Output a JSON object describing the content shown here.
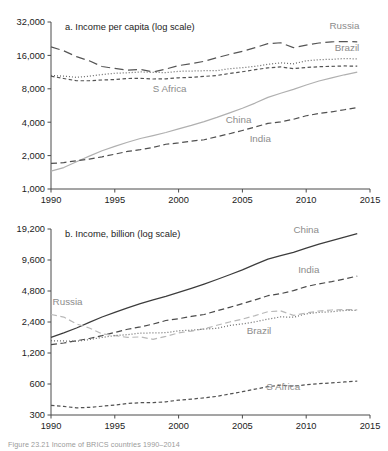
{
  "figure": {
    "caption": "Figure 23.21 Income of BRICS countries 1990–2014"
  },
  "chart_data": [
    {
      "id": "a",
      "type": "line",
      "title": "a. Income per capita (log scale)",
      "xlabel": "",
      "ylabel": "",
      "scale": "log",
      "grid": false,
      "legend_position": "inline-labels",
      "xlim": [
        1990,
        2015
      ],
      "ylim": [
        1000,
        32000
      ],
      "xticks": [
        1990,
        1995,
        2000,
        2005,
        2010,
        2015
      ],
      "xtick_labels": [
        "1990",
        "1995",
        "2000",
        "2005",
        "2010",
        "2015"
      ],
      "yticks": [
        1000,
        2000,
        4000,
        8000,
        16000,
        32000
      ],
      "ytick_labels": [
        "1,000",
        "2,000",
        "4,000",
        "8,000",
        "16,000",
        "32,000"
      ],
      "x": [
        1990,
        1991,
        1992,
        1993,
        1994,
        1995,
        1996,
        1997,
        1998,
        1999,
        2000,
        2001,
        2002,
        2003,
        2004,
        2005,
        2006,
        2007,
        2008,
        2009,
        2010,
        2011,
        2012,
        2013,
        2014
      ],
      "series": [
        {
          "name": "Russia",
          "style": "long-dash",
          "color": "#555555",
          "label_x": 2013.0,
          "label_y": 27500,
          "values": [
            19100,
            17600,
            15600,
            14300,
            12700,
            12200,
            11800,
            11950,
            11350,
            12050,
            12950,
            13500,
            14150,
            15250,
            16350,
            17400,
            18800,
            20400,
            20800,
            18800,
            19800,
            20700,
            21200,
            21350,
            21200
          ]
        },
        {
          "name": "Brazil",
          "style": "dotted",
          "color": "#6a6a6a",
          "label_x": 2013.2,
          "label_y": 17600,
          "values": [
            10550,
            10400,
            10150,
            10400,
            10750,
            11050,
            11150,
            11350,
            11250,
            11200,
            11500,
            11550,
            11650,
            11650,
            12150,
            12400,
            12750,
            13300,
            13700,
            13450,
            14300,
            14650,
            14750,
            15000,
            14850
          ]
        },
        {
          "name": "S Africa",
          "style": "short-dash",
          "color": "#545454",
          "label_x": 1999.3,
          "label_y": 7450,
          "values": [
            10400,
            9900,
            9450,
            9450,
            9600,
            9700,
            9900,
            9950,
            9800,
            9850,
            10050,
            10150,
            10350,
            10550,
            11000,
            11400,
            11900,
            12350,
            12600,
            12150,
            12450,
            12650,
            12750,
            12850,
            12800
          ]
        },
        {
          "name": "China",
          "style": "solid",
          "color": "#b0b0b0",
          "label_x": 2004.7,
          "label_y": 3900,
          "values": [
            1450,
            1560,
            1760,
            1980,
            2210,
            2420,
            2640,
            2850,
            3030,
            3230,
            3480,
            3740,
            4050,
            4420,
            4860,
            5350,
            5950,
            6700,
            7300,
            7900,
            8650,
            9400,
            10050,
            10700,
            11300
          ]
        },
        {
          "name": "India",
          "style": "medium-dash",
          "color": "#4f4f4f",
          "label_x": 2006.4,
          "label_y": 2650,
          "values": [
            1700,
            1730,
            1800,
            1860,
            1950,
            2060,
            2180,
            2260,
            2370,
            2530,
            2600,
            2700,
            2780,
            2960,
            3150,
            3370,
            3620,
            3900,
            4030,
            4250,
            4570,
            4790,
            4960,
            5180,
            5430
          ]
        }
      ]
    },
    {
      "id": "b",
      "type": "line",
      "title": "b. Income, billion (log scale)",
      "xlabel": "",
      "ylabel": "",
      "scale": "log",
      "grid": false,
      "legend_position": "inline-labels",
      "xlim": [
        1990,
        2015
      ],
      "ylim": [
        300,
        19200
      ],
      "xticks": [
        1990,
        1995,
        2000,
        2005,
        2010,
        2015
      ],
      "xtick_labels": [
        "1990",
        "1995",
        "2000",
        "2005",
        "2010",
        "2015"
      ],
      "yticks": [
        300,
        600,
        1200,
        2400,
        4800,
        9600,
        19200
      ],
      "ytick_labels": [
        "300",
        "600",
        "1,200",
        "2,400",
        "4,800",
        "9,600",
        "19,200"
      ],
      "x": [
        1990,
        1991,
        1992,
        1993,
        1994,
        1995,
        1996,
        1997,
        1998,
        1999,
        2000,
        2001,
        2002,
        2003,
        2004,
        2005,
        2006,
        2007,
        2008,
        2009,
        2010,
        2011,
        2012,
        2013,
        2014
      ],
      "series": [
        {
          "name": "China",
          "style": "solid",
          "color": "#3c3c3c",
          "label_x": 2010.0,
          "label_y": 17600,
          "values": [
            1700,
            1880,
            2100,
            2380,
            2680,
            2980,
            3290,
            3620,
            3930,
            4260,
            4650,
            5090,
            5600,
            6200,
            6900,
            7700,
            8700,
            9800,
            10600,
            11400,
            12500,
            13700,
            14800,
            16000,
            17300
          ]
        },
        {
          "name": "India",
          "style": "medium-dash",
          "color": "#4a4a4a",
          "label_x": 2010.2,
          "label_y": 7100,
          "values": [
            1450,
            1500,
            1580,
            1660,
            1770,
            1900,
            2040,
            2150,
            2290,
            2480,
            2580,
            2720,
            2840,
            3080,
            3330,
            3620,
            3940,
            4320,
            4520,
            4840,
            5300,
            5630,
            5920,
            6290,
            6700
          ]
        },
        {
          "name": "Russia",
          "style": "light-dash",
          "color": "#b8b8b8",
          "label_x": 1991.3,
          "label_y": 3500,
          "values": [
            2840,
            2680,
            2300,
            2100,
            1840,
            1770,
            1700,
            1720,
            1630,
            1740,
            1880,
            1960,
            2060,
            2230,
            2400,
            2560,
            2770,
            3020,
            3080,
            2780,
            2940,
            3070,
            3140,
            3170,
            3150
          ]
        },
        {
          "name": "Brazil",
          "style": "dotted",
          "color": "#6c6c6c",
          "label_x": 2006.3,
          "label_y": 1850,
          "values": [
            1580,
            1570,
            1560,
            1620,
            1700,
            1770,
            1810,
            1870,
            1880,
            1890,
            1970,
            2000,
            2050,
            2080,
            2220,
            2300,
            2410,
            2560,
            2690,
            2670,
            2880,
            2980,
            3020,
            3110,
            3110
          ]
        },
        {
          "name": "S Africa",
          "style": "short-dash",
          "color": "#525252",
          "label_x": 2008.2,
          "label_y": 520,
          "values": [
            372,
            363,
            352,
            356,
            365,
            375,
            388,
            395,
            396,
            403,
            418,
            428,
            440,
            455,
            480,
            505,
            535,
            565,
            585,
            572,
            590,
            605,
            615,
            628,
            640
          ]
        }
      ]
    }
  ]
}
